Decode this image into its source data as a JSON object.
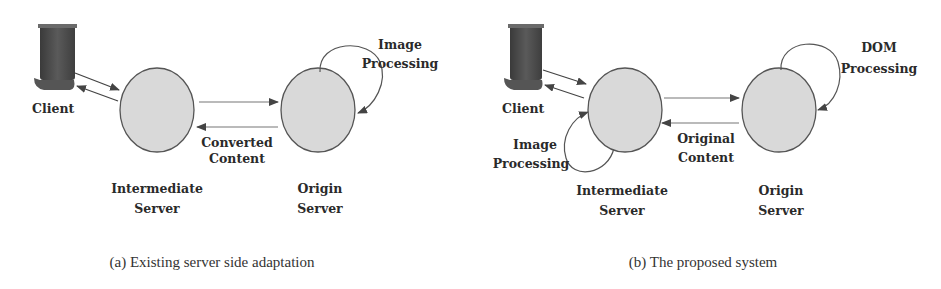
{
  "panels": [
    {
      "id": "a",
      "caption": "(a) Existing server side adaptation",
      "client_label": "Client",
      "intermediate_label": [
        "Intermediate",
        "Server"
      ],
      "origin_label": [
        "Origin",
        "Server"
      ],
      "edge_label": [
        "Converted",
        "Content"
      ],
      "loop_label": [
        "Image",
        "Processing"
      ],
      "loop_on": "origin"
    },
    {
      "id": "b",
      "caption": "(b) The proposed system",
      "client_label": "Client",
      "intermediate_label": [
        "Intermediate",
        "Server"
      ],
      "origin_label": [
        "Origin",
        "Server"
      ],
      "edge_label": [
        "Original",
        "Content"
      ],
      "intermediate_loop_label": [
        "Image",
        "Processing"
      ],
      "origin_loop_label": [
        "DOM",
        "Processing"
      ]
    }
  ],
  "colors": {
    "node_fill": "#d9d9d9",
    "node_stroke": "#555555",
    "client_device": "#4a4a4a",
    "arrow": "#444444",
    "text": "#2a2a2a"
  }
}
